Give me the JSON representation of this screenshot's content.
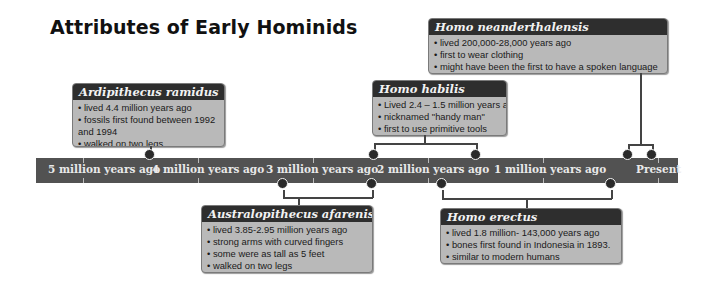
{
  "title": "Attributes of Early Hominids",
  "timeline": {
    "labels": [
      "5 million years ago",
      "4 million years ago",
      "3 million years ago",
      "2 million years ago",
      "1 million years ago",
      "Present"
    ],
    "bar_color": "#525252"
  },
  "hominids": [
    {
      "name": "Ardipithecus ramidus",
      "facts": [
        "• lived 4.4 million years ago",
        "• fossils first found between 1992",
        "and 1994",
        "• walked on two legs"
      ]
    },
    {
      "name": "Homo habilis",
      "facts": [
        "• Lived 2.4 – 1.5 million years ago",
        "• nicknamed \"handy man\"",
        "• first to use primitive tools"
      ]
    },
    {
      "name": "Homo neanderthalensis",
      "facts": [
        "• lived 200,000-28,000 years ago",
        "• first to wear clothing",
        "• might have been the first to have a spoken language"
      ]
    },
    {
      "name": "Australopithecus afarenis",
      "facts": [
        "• lived 3.85-2.95 million years ago",
        "• strong arms with curved fingers",
        "• some were as tall as 5 feet",
        "• walked on two legs"
      ]
    },
    {
      "name": "Homo erectus",
      "facts": [
        "• lived 1.8 million- 143,000 years ago",
        "• bones first found in Indonesia in 1893.",
        "• similar to modern humans"
      ]
    }
  ]
}
